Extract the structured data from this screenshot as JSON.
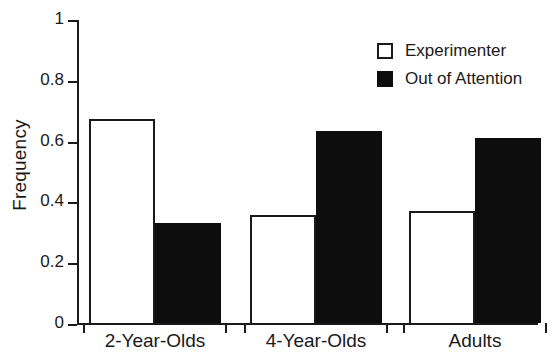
{
  "chart_data": {
    "type": "bar",
    "title": "",
    "xlabel": "",
    "ylabel": "Frequency",
    "categories": [
      "2-Year-Olds",
      "4-Year-Olds",
      "Adults"
    ],
    "series": [
      {
        "name": "Experimenter",
        "values": [
          0.67,
          0.355,
          0.37
        ],
        "style": "open",
        "color": "#ffffff"
      },
      {
        "name": "Out of Attention",
        "values": [
          0.33,
          0.63,
          0.61
        ],
        "style": "filled",
        "color": "#0d0d0d"
      }
    ],
    "ylim": [
      0,
      1
    ],
    "yticks": [
      "0",
      "0.2",
      "0.4",
      "0.6",
      "0.8",
      "1"
    ],
    "ytick_values": [
      0,
      0.2,
      0.4,
      0.6,
      0.8,
      1
    ],
    "grid": false,
    "legend_position": "top-right",
    "axis_color": "#1a1a1a"
  },
  "legend": {
    "entries": [
      {
        "label": "Experimenter",
        "swatch": "open-square-icon"
      },
      {
        "label": "Out of Attention",
        "swatch": "filled-square-icon"
      }
    ]
  }
}
